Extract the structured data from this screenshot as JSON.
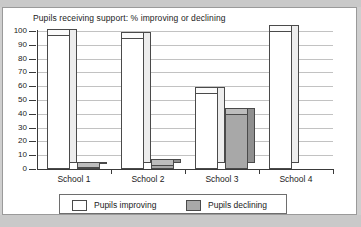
{
  "chart_data": {
    "type": "bar",
    "title": "Pupils receiving support: % improving or declining",
    "xlabel": "",
    "ylabel": "",
    "ylim": [
      0,
      100
    ],
    "ytick_step": 10,
    "yticks": [
      100,
      90,
      80,
      70,
      60,
      50,
      40,
      30,
      20,
      10,
      0
    ],
    "grid": true,
    "legend_position": "bottom",
    "style": "3d-bar",
    "categories": [
      "School 1",
      "School 2",
      "School 3",
      "School 4"
    ],
    "series": [
      {
        "name": "Pupils improving",
        "color": "#ffffff",
        "values": [
          97,
          95,
          55,
          100
        ]
      },
      {
        "name": "Pupils declining",
        "color": "#a8a8a8",
        "values": [
          1,
          3,
          40,
          0
        ]
      }
    ]
  },
  "legend": {
    "items": [
      {
        "label": "Pupils improving",
        "swatch": "white"
      },
      {
        "label": "Pupils declining",
        "swatch": "gray"
      }
    ]
  },
  "colors": {
    "bar_improving": "#ffffff",
    "bar_declining": "#a8a8a8",
    "outline": "#4a4a4a",
    "gridline": "#c2c2c2",
    "axis": "#3a3a3a",
    "page_band": "#c9c9c9",
    "sheet": "#ffffff"
  }
}
